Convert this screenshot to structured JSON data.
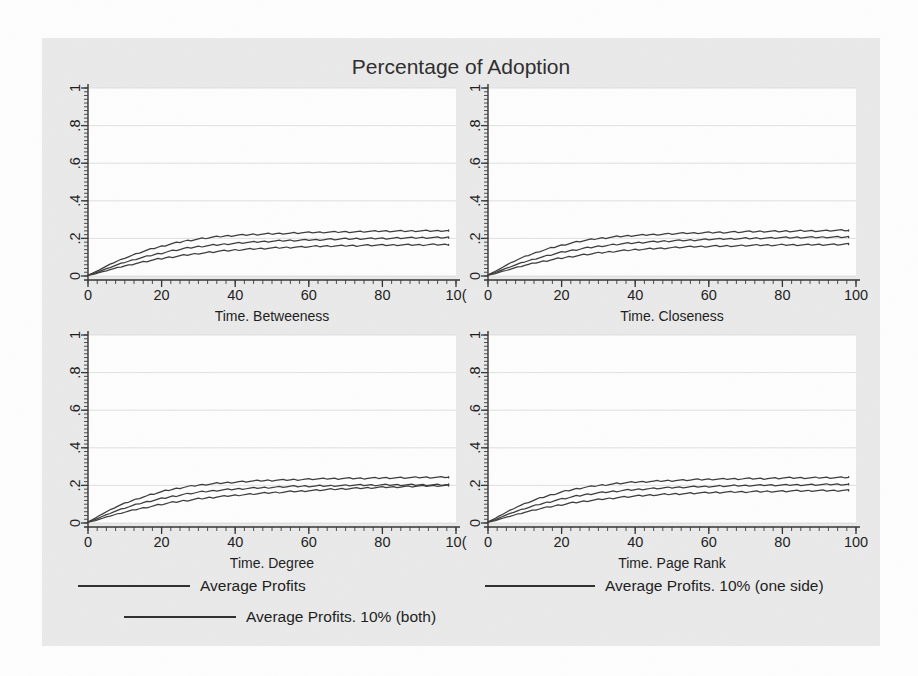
{
  "figure": {
    "title": "Percentage of Adoption",
    "background_color": "#e9e9e9",
    "plot_background_color": "#fdfdfd",
    "line_color": "#3c3c3c"
  },
  "chart_data": {
    "type": "line",
    "title": "Percentage of Adoption",
    "panels": [
      {
        "xlabel": "Time. Betweeness",
        "ylabel": "",
        "xlim": [
          0,
          100
        ],
        "ylim": [
          0,
          1
        ],
        "xticks": [
          0,
          20,
          40,
          60,
          80,
          100
        ],
        "xtick_labels": [
          "0",
          "20",
          "40",
          "60",
          "80",
          "10("
        ],
        "yticks": [
          0,
          0.2,
          0.4,
          0.6,
          0.8,
          1
        ],
        "ytick_labels": [
          "0",
          ".2",
          ".4",
          ".6",
          ".8",
          "1"
        ],
        "grid": true,
        "x": [
          0,
          2,
          4,
          6,
          8,
          10,
          14,
          18,
          22,
          26,
          30,
          35,
          40,
          45,
          50,
          55,
          60,
          65,
          70,
          75,
          80,
          85,
          90,
          95,
          98
        ],
        "series": [
          {
            "name": "Average Profits",
            "values": [
              0.005,
              0.022,
              0.042,
              0.062,
              0.08,
              0.096,
              0.124,
              0.148,
              0.168,
              0.185,
              0.197,
              0.208,
              0.216,
              0.221,
              0.225,
              0.228,
              0.231,
              0.233,
              0.235,
              0.236,
              0.238,
              0.239,
              0.24,
              0.241,
              0.242
            ]
          },
          {
            "name": "Average Profits. 10% (one side)",
            "values": [
              0.004,
              0.016,
              0.031,
              0.046,
              0.06,
              0.073,
              0.095,
              0.114,
              0.131,
              0.145,
              0.156,
              0.166,
              0.174,
              0.18,
              0.185,
              0.189,
              0.192,
              0.195,
              0.197,
              0.199,
              0.2,
              0.202,
              0.203,
              0.204,
              0.205
            ]
          },
          {
            "name": "Average Profits. 10% (both)",
            "values": [
              0.003,
              0.012,
              0.023,
              0.034,
              0.044,
              0.054,
              0.071,
              0.086,
              0.099,
              0.11,
              0.12,
              0.13,
              0.138,
              0.144,
              0.149,
              0.153,
              0.156,
              0.159,
              0.161,
              0.163,
              0.164,
              0.165,
              0.166,
              0.167,
              0.168
            ]
          }
        ]
      },
      {
        "xlabel": "Time. Closeness",
        "ylabel": "",
        "xlim": [
          0,
          100
        ],
        "ylim": [
          0,
          1
        ],
        "xticks": [
          0,
          20,
          40,
          60,
          80,
          100
        ],
        "xtick_labels": [
          "0",
          "20",
          "40",
          "60",
          "80",
          "100"
        ],
        "yticks": [
          0,
          0.2,
          0.4,
          0.6,
          0.8,
          1
        ],
        "ytick_labels": [
          "0",
          ".2",
          ".4",
          ".6",
          ".8",
          "1"
        ],
        "grid": true,
        "x": [
          0,
          2,
          4,
          6,
          8,
          10,
          14,
          18,
          22,
          26,
          30,
          35,
          40,
          45,
          50,
          55,
          60,
          65,
          70,
          75,
          80,
          85,
          90,
          95,
          98
        ],
        "series": [
          {
            "name": "Average Profits",
            "values": [
              0.006,
              0.025,
              0.047,
              0.068,
              0.087,
              0.103,
              0.131,
              0.154,
              0.173,
              0.188,
              0.199,
              0.209,
              0.216,
              0.221,
              0.225,
              0.228,
              0.231,
              0.233,
              0.235,
              0.237,
              0.238,
              0.24,
              0.241,
              0.242,
              0.243
            ]
          },
          {
            "name": "Average Profits. 10% (one side)",
            "values": [
              0.005,
              0.018,
              0.034,
              0.049,
              0.063,
              0.076,
              0.098,
              0.117,
              0.133,
              0.147,
              0.158,
              0.168,
              0.176,
              0.182,
              0.187,
              0.191,
              0.195,
              0.197,
              0.2,
              0.202,
              0.203,
              0.205,
              0.206,
              0.207,
              0.208
            ]
          },
          {
            "name": "Average Profits. 10% (both)",
            "values": [
              0.004,
              0.013,
              0.025,
              0.036,
              0.047,
              0.057,
              0.074,
              0.089,
              0.102,
              0.113,
              0.122,
              0.132,
              0.14,
              0.146,
              0.151,
              0.155,
              0.158,
              0.16,
              0.162,
              0.164,
              0.165,
              0.166,
              0.167,
              0.168,
              0.169
            ]
          }
        ]
      },
      {
        "xlabel": "Time. Degree",
        "ylabel": "",
        "xlim": [
          0,
          100
        ],
        "ylim": [
          0,
          1
        ],
        "xticks": [
          0,
          20,
          40,
          60,
          80,
          100
        ],
        "xtick_labels": [
          "0",
          "20",
          "40",
          "60",
          "80",
          "10("
        ],
        "yticks": [
          0,
          0.2,
          0.4,
          0.6,
          0.8,
          1
        ],
        "ytick_labels": [
          "0",
          ".2",
          ".4",
          ".6",
          ".8",
          "1"
        ],
        "grid": true,
        "x": [
          0,
          2,
          4,
          6,
          8,
          10,
          14,
          18,
          22,
          26,
          30,
          35,
          40,
          45,
          50,
          55,
          60,
          65,
          70,
          75,
          80,
          85,
          90,
          95,
          98
        ],
        "series": [
          {
            "name": "Average Profits",
            "values": [
              0.006,
              0.026,
              0.049,
              0.07,
              0.089,
              0.105,
              0.133,
              0.156,
              0.175,
              0.19,
              0.201,
              0.211,
              0.218,
              0.223,
              0.227,
              0.23,
              0.233,
              0.235,
              0.237,
              0.238,
              0.24,
              0.241,
              0.242,
              0.243,
              0.244
            ]
          },
          {
            "name": "Average Profits. 10% (one side)",
            "values": [
              0.005,
              0.019,
              0.036,
              0.052,
              0.067,
              0.08,
              0.103,
              0.122,
              0.138,
              0.152,
              0.163,
              0.173,
              0.18,
              0.186,
              0.19,
              0.194,
              0.196,
              0.198,
              0.2,
              0.201,
              0.202,
              0.203,
              0.203,
              0.204,
              0.204
            ]
          },
          {
            "name": "Average Profits. 10% (both)",
            "values": [
              0.004,
              0.013,
              0.025,
              0.037,
              0.048,
              0.058,
              0.076,
              0.092,
              0.106,
              0.118,
              0.128,
              0.139,
              0.148,
              0.155,
              0.161,
              0.167,
              0.172,
              0.177,
              0.182,
              0.186,
              0.19,
              0.193,
              0.196,
              0.198,
              0.199
            ]
          }
        ]
      },
      {
        "xlabel": "Time. Page Rank",
        "ylabel": "",
        "xlim": [
          0,
          100
        ],
        "ylim": [
          0,
          1
        ],
        "xticks": [
          0,
          20,
          40,
          60,
          80,
          100
        ],
        "xtick_labels": [
          "0",
          "20",
          "40",
          "60",
          "80",
          "100"
        ],
        "yticks": [
          0,
          0.2,
          0.4,
          0.6,
          0.8,
          1
        ],
        "ytick_labels": [
          "0",
          ".2",
          ".4",
          ".6",
          ".8",
          "1"
        ],
        "grid": true,
        "x": [
          0,
          2,
          4,
          6,
          8,
          10,
          14,
          18,
          22,
          26,
          30,
          35,
          40,
          45,
          50,
          55,
          60,
          65,
          70,
          75,
          80,
          85,
          90,
          95,
          98
        ],
        "series": [
          {
            "name": "Average Profits",
            "values": [
              0.006,
              0.025,
              0.047,
              0.068,
              0.087,
              0.103,
              0.131,
              0.154,
              0.174,
              0.189,
              0.2,
              0.21,
              0.217,
              0.222,
              0.226,
              0.229,
              0.232,
              0.234,
              0.236,
              0.237,
              0.239,
              0.24,
              0.241,
              0.242,
              0.243
            ]
          },
          {
            "name": "Average Profits. 10% (one side)",
            "values": [
              0.005,
              0.018,
              0.035,
              0.05,
              0.064,
              0.077,
              0.1,
              0.119,
              0.135,
              0.149,
              0.16,
              0.17,
              0.178,
              0.184,
              0.188,
              0.192,
              0.195,
              0.197,
              0.199,
              0.201,
              0.202,
              0.203,
              0.204,
              0.205,
              0.206
            ]
          },
          {
            "name": "Average Profits. 10% (both)",
            "values": [
              0.004,
              0.013,
              0.025,
              0.036,
              0.047,
              0.057,
              0.075,
              0.09,
              0.104,
              0.115,
              0.125,
              0.135,
              0.143,
              0.149,
              0.154,
              0.158,
              0.161,
              0.164,
              0.166,
              0.168,
              0.169,
              0.171,
              0.172,
              0.173,
              0.174
            ]
          }
        ]
      }
    ],
    "legend": {
      "position": "bottom",
      "entries": [
        "Average Profits",
        "Average Profits. 10% (one side)",
        "Average Profits. 10% (both)"
      ]
    }
  }
}
